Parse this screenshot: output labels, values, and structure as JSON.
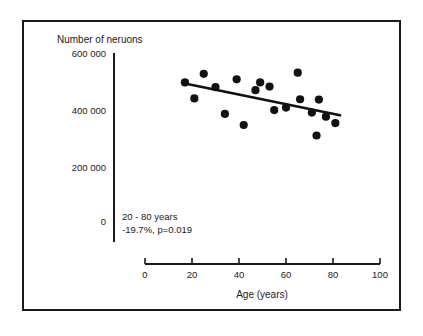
{
  "figure": {
    "background_color": "#ffffff",
    "frame_color": "#1a1a1a",
    "point_color": "#111111",
    "line_color": "#111111"
  },
  "chart_data": {
    "type": "scatter",
    "title": "",
    "subtitle": "",
    "xlabel": "Age (years)",
    "ylabel": "Number of neruons",
    "xlim": [
      0,
      100
    ],
    "ylim": [
      0,
      600000
    ],
    "xticks": [
      0,
      20,
      40,
      60,
      80,
      100
    ],
    "xticklabels": [
      "0",
      "20",
      "40",
      "60",
      "80",
      "100"
    ],
    "yticks": [
      0,
      200000,
      400000,
      600000
    ],
    "yticklabels": [
      "0",
      "200 000",
      "400 000",
      "600 000"
    ],
    "grid": false,
    "legend": null,
    "annotations": [
      "20 - 80 years",
      "-19.7%, p=0.019"
    ],
    "series": [
      {
        "name": "subjects",
        "marker": "filled-circle",
        "x": [
          17,
          21,
          25,
          30,
          34,
          39,
          42,
          47,
          49,
          53,
          55,
          60,
          65,
          66,
          71,
          73,
          74,
          77,
          81
        ],
        "y": [
          501000,
          443000,
          532000,
          484000,
          387000,
          512000,
          347000,
          473000,
          501000,
          486000,
          401000,
          410000,
          536000,
          440000,
          392000,
          309000,
          439000,
          377000,
          354000
        ]
      }
    ],
    "trendline": {
      "name": "regression",
      "x": [
        17,
        83
      ],
      "y": [
        497000,
        382000
      ]
    }
  },
  "axis": {
    "y_axis_label": "Number of neruons",
    "x_axis_label": "Age (years)"
  }
}
